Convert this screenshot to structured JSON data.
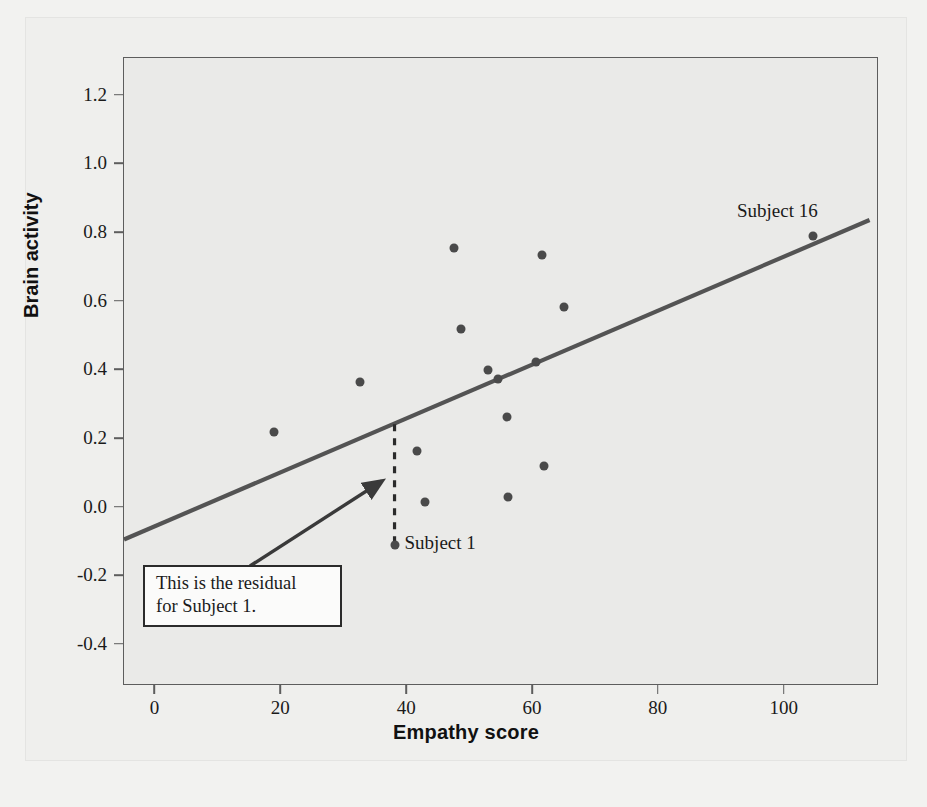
{
  "chart_data": {
    "type": "scatter",
    "title": "",
    "xlabel": "Empathy score",
    "ylabel": "Brain activity",
    "xlim": [
      -5,
      115
    ],
    "ylim": [
      -0.52,
      1.31
    ],
    "xticks": [
      0,
      20,
      40,
      60,
      80,
      100
    ],
    "xtick_labels": [
      "0",
      "20",
      "40",
      "60",
      "80",
      "100"
    ],
    "yticks": [
      -0.4,
      -0.2,
      0.0,
      0.2,
      0.4,
      0.6,
      0.8,
      1.0,
      1.2
    ],
    "ytick_labels": [
      "-0.4",
      "-0.2",
      "0.0",
      "0.2",
      "0.4",
      "0.6",
      "0.8",
      "1.0",
      "1.2"
    ],
    "grid": false,
    "legend": "none",
    "point_color": "#4a4a4a",
    "line_color": "#545454",
    "points": [
      {
        "x": 18.8,
        "y": 0.22
      },
      {
        "x": 32.5,
        "y": 0.365
      },
      {
        "x": 38.0,
        "y": -0.11
      },
      {
        "x": 41.5,
        "y": 0.165
      },
      {
        "x": 42.8,
        "y": 0.015
      },
      {
        "x": 47.5,
        "y": 0.755
      },
      {
        "x": 48.5,
        "y": 0.52
      },
      {
        "x": 52.8,
        "y": 0.4
      },
      {
        "x": 54.5,
        "y": 0.375
      },
      {
        "x": 55.8,
        "y": 0.265
      },
      {
        "x": 56.0,
        "y": 0.03
      },
      {
        "x": 60.5,
        "y": 0.425
      },
      {
        "x": 61.5,
        "y": 0.735
      },
      {
        "x": 61.8,
        "y": 0.12
      },
      {
        "x": 65.0,
        "y": 0.585
      },
      {
        "x": 104.5,
        "y": 0.79
      }
    ],
    "regression_line": {
      "x_start": -5,
      "y_start": -0.093,
      "x_end": 113.5,
      "y_end": 0.838
    },
    "residual_marker": {
      "subject": "Subject 1",
      "x": 38.0,
      "y_point": -0.11,
      "y_line": 0.243
    },
    "point_labels": [
      {
        "text": "Subject 16",
        "x": 104.5,
        "y": 0.79
      },
      {
        "text": "Subject 1",
        "x": 38.0,
        "y": -0.11
      }
    ],
    "annotation": {
      "line1": "This is the residual",
      "line2": "for Subject 1."
    }
  },
  "figure": {
    "background": "#efefed",
    "plot_background": "#eaeae8",
    "frame_color": "#5d5d5d"
  }
}
